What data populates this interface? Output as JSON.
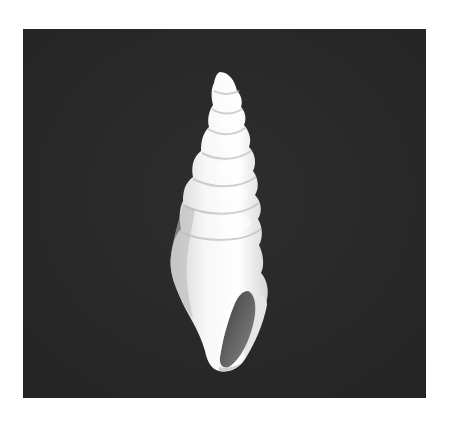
{
  "image": {
    "subject": "gastropod shell",
    "description": "Photograph of a white, high-spired turriculate gastropod shell with an oval aperture, photographed against a dark textured background",
    "background_color": "#2a2a2a",
    "shell_color": "#f2f2f2",
    "aperture_color": "#5a5a5a",
    "page_color": "#ffffff"
  }
}
